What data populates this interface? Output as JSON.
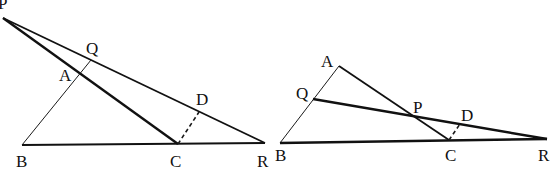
{
  "figures": [
    {
      "name": "left-figure",
      "points": {
        "P": {
          "label": "P",
          "x": 3,
          "y": 18,
          "lx": -2,
          "ly": 9
        },
        "Q": {
          "label": "Q",
          "x": 91,
          "y": 60,
          "lx": 86,
          "ly": 54
        },
        "A": {
          "label": "A",
          "x": 79,
          "y": 74,
          "lx": 59,
          "ly": 81
        },
        "B": {
          "label": "B",
          "x": 22,
          "y": 145,
          "lx": 16,
          "ly": 167
        },
        "C": {
          "label": "C",
          "x": 178,
          "y": 144,
          "lx": 170,
          "ly": 167
        },
        "D": {
          "label": "D",
          "x": 199,
          "y": 112,
          "lx": 196,
          "ly": 105
        },
        "R": {
          "label": "R",
          "x": 265,
          "y": 143,
          "lx": 257,
          "ly": 167
        }
      },
      "segments": [
        {
          "from": "P",
          "to": "R",
          "style": "med"
        },
        {
          "from": "P",
          "to": "C",
          "style": "thick"
        },
        {
          "from": "B",
          "to": "R",
          "style": "med"
        },
        {
          "from": "B",
          "to": "Q",
          "style": "thin"
        },
        {
          "from": "C",
          "to": "D",
          "style": "dash"
        }
      ]
    },
    {
      "name": "right-figure",
      "points": {
        "A": {
          "label": "A",
          "x": 339,
          "y": 66,
          "lx": 321,
          "ly": 67
        },
        "Q": {
          "label": "Q",
          "x": 313,
          "y": 99,
          "lx": 296,
          "ly": 99
        },
        "P": {
          "label": "P",
          "x": 411,
          "y": 116,
          "lx": 413,
          "ly": 113
        },
        "D": {
          "label": "D",
          "x": 460,
          "y": 124,
          "lx": 461,
          "ly": 121
        },
        "B": {
          "label": "B",
          "x": 280,
          "y": 143,
          "lx": 275,
          "ly": 161
        },
        "C": {
          "label": "C",
          "x": 449,
          "y": 140,
          "lx": 445,
          "ly": 161
        },
        "R": {
          "label": "R",
          "x": 547,
          "y": 139,
          "lx": 538,
          "ly": 161
        }
      },
      "segments": [
        {
          "from": "B",
          "to": "A",
          "style": "thin"
        },
        {
          "from": "A",
          "to": "C",
          "style": "med"
        },
        {
          "from": "Q",
          "to": "R",
          "style": "thick"
        },
        {
          "from": "B",
          "to": "R",
          "style": "thick"
        },
        {
          "from": "C",
          "to": "D",
          "style": "dash"
        }
      ]
    }
  ],
  "labels": {
    "left": {
      "P": "P",
      "Q": "Q",
      "A": "A",
      "B": "B",
      "C": "C",
      "D": "D",
      "R": "R"
    },
    "right": {
      "A": "A",
      "Q": "Q",
      "P": "P",
      "D": "D",
      "B": "B",
      "C": "C",
      "R": "R"
    }
  },
  "colors": {
    "ink": "#111111",
    "background": "#ffffff"
  }
}
